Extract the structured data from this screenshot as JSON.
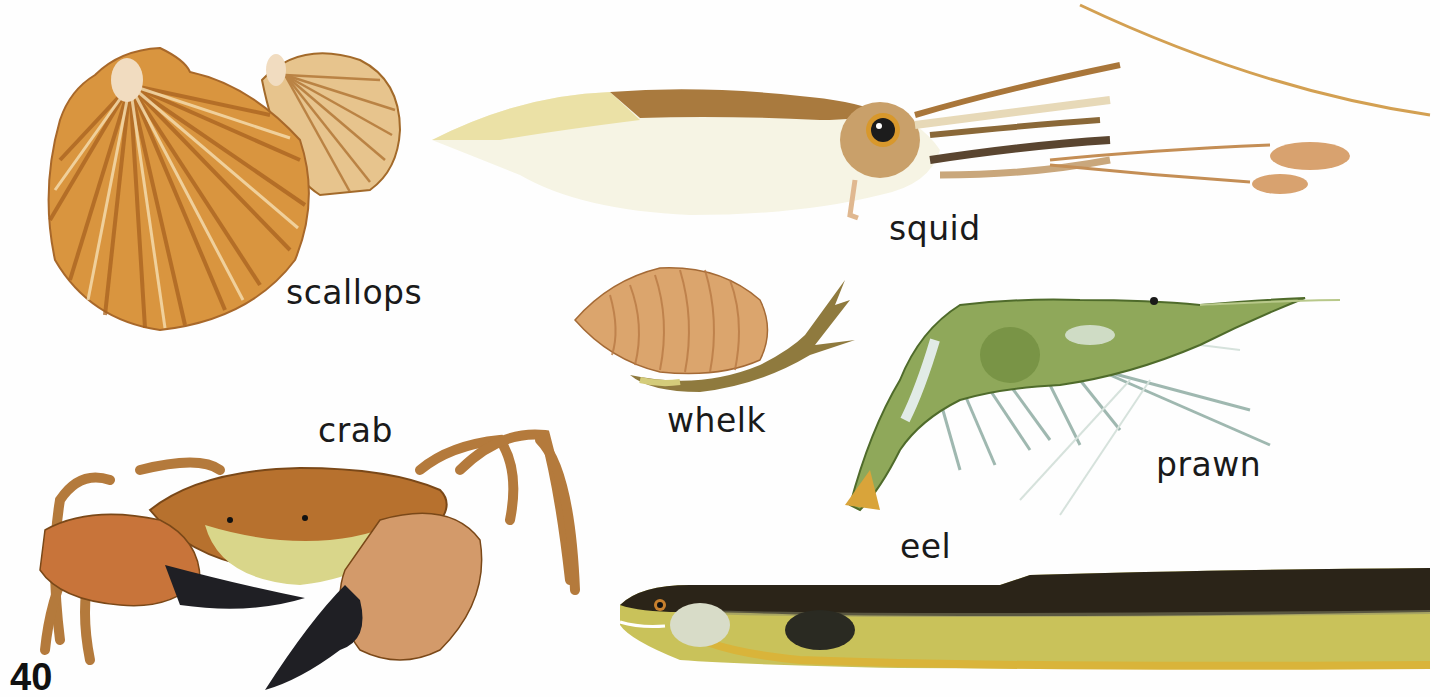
{
  "page": {
    "number": "40",
    "background": "#fefefe"
  },
  "animals": [
    {
      "id": "scallops",
      "label": "scallops",
      "colors": {
        "shell": "#d9953f",
        "rib": "#b36a24",
        "light": "#f3dcb0"
      }
    },
    {
      "id": "squid",
      "label": "squid",
      "colors": {
        "mantle": "#f7f3df",
        "back": "#a97a3e",
        "eye": "#1c1c1c",
        "fin": "#ece1a8"
      }
    },
    {
      "id": "whelk",
      "label": "whelk",
      "colors": {
        "shell": "#dba56d",
        "stripe": "#b97a45",
        "body": "#8f7a3e"
      }
    },
    {
      "id": "prawn",
      "label": "prawn",
      "colors": {
        "body": "#8fa85a",
        "dark": "#5d7a35",
        "tail": "#d9a43a",
        "legs": "#9fb8b0"
      }
    },
    {
      "id": "crab",
      "label": "crab",
      "colors": {
        "shell": "#b7712e",
        "claw": "#c8743a",
        "tip": "#1f1f24",
        "belly": "#d9d68a"
      }
    },
    {
      "id": "eel",
      "label": "eel",
      "colors": {
        "back": "#2b2418",
        "belly": "#c9c25a",
        "underside": "#d9b43a"
      }
    }
  ]
}
